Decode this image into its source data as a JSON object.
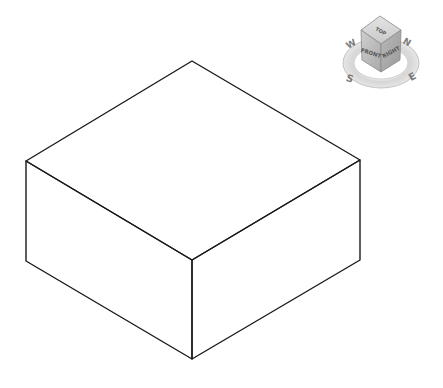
{
  "scene": {
    "background": "#ffffff",
    "box": {
      "stroke": "#1a1a1a",
      "stroke_width": 1.4,
      "vertices": {
        "top_back": [
          192,
          61
        ],
        "top_left": [
          26,
          161
        ],
        "top_right": [
          360,
          160
        ],
        "top_front": [
          192,
          260
        ],
        "bottom_left": [
          26,
          261
        ],
        "bottom_right": [
          360,
          260
        ],
        "bottom_front": [
          192,
          359
        ]
      }
    }
  },
  "viewcube": {
    "faces": {
      "top": "TOP",
      "front": "FRONT",
      "right": "RIGHT"
    },
    "compass": {
      "north": "N",
      "south": "S",
      "east": "E",
      "west": "W"
    },
    "colors": {
      "top_face": "#d9d9d9",
      "front_face": "#bdbdbd",
      "right_face": "#a8a8a8",
      "ring": "#cfcfcf"
    }
  }
}
